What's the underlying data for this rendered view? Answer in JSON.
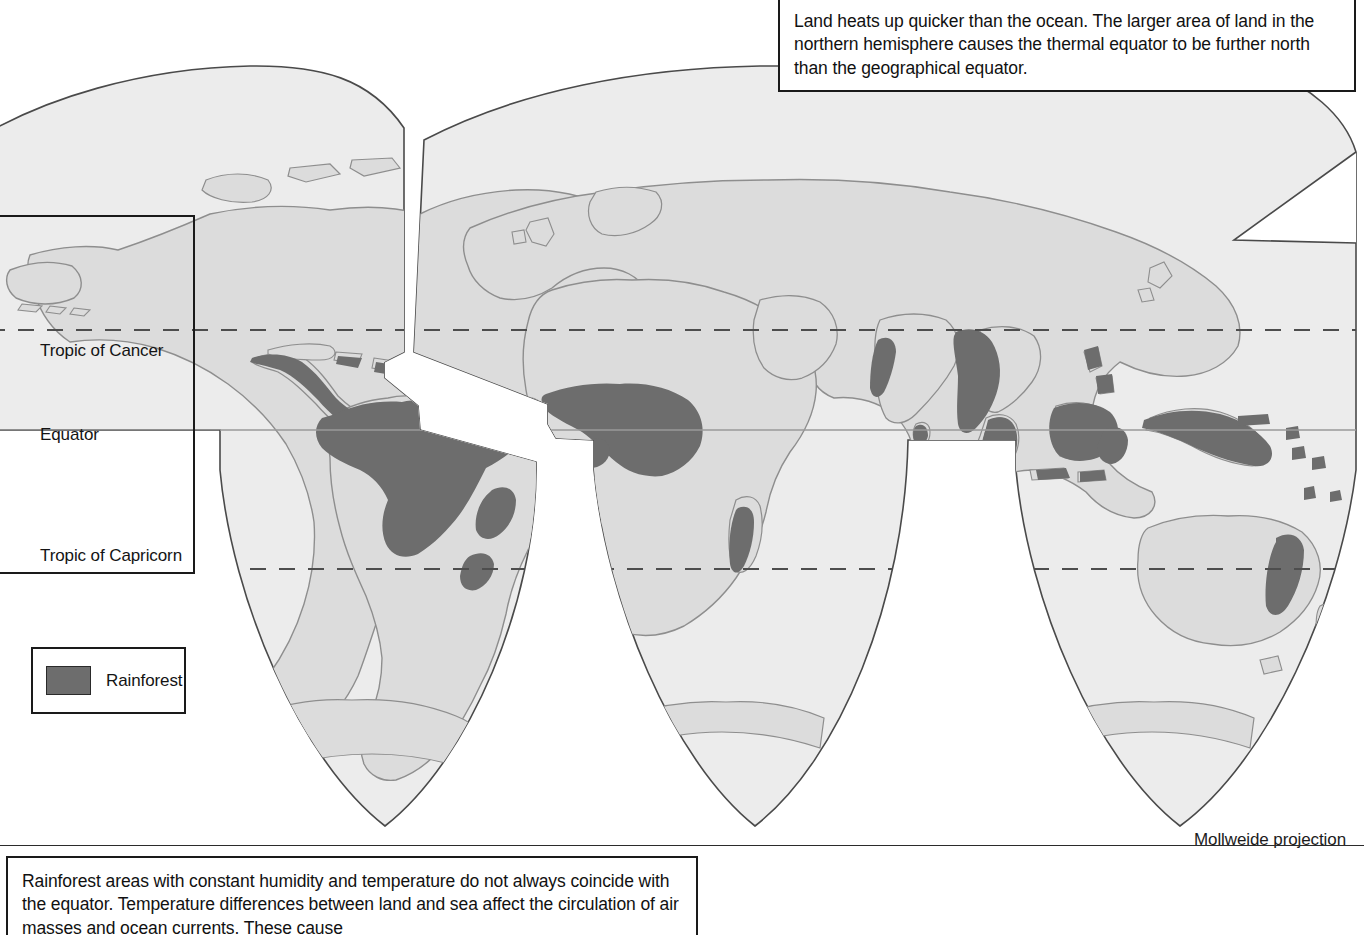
{
  "document": {
    "kind": "thematic-world-map",
    "projection_label": "Mollweide projection"
  },
  "top_callout": {
    "name": "thermal-equator-note",
    "text": "Land heats up quicker than the ocean. The larger area of land in the northern hemisphere causes the thermal equator to be further north than the geographical equator."
  },
  "bottom_callout": {
    "name": "rainforest-note",
    "text": "Rainforest areas with constant humidity and temperature do not always coincide with the equator. Temperature differences between land and sea affect the circulation of air masses and ocean currents. These cause"
  },
  "latitude_labels": {
    "tropic_of_cancer": "Tropic of Cancer",
    "equator": "Equator",
    "tropic_of_capricorn": "Tropic of Capricorn"
  },
  "legend": {
    "title": "",
    "items": [
      {
        "label": "Rainforest",
        "color": "#6d6d6d"
      }
    ]
  },
  "colors": {
    "ocean": "#ececec",
    "land": "#dcdcdc",
    "rainforest": "#6d6d6d",
    "outline": "#8e8e8e",
    "graticule": "#3c3c3c",
    "border": "#1a1a1a",
    "page": "#ffffff"
  },
  "map_features": {
    "graticule_lines": [
      {
        "name": "tropic-of-cancer",
        "style": "dashed"
      },
      {
        "name": "equator",
        "style": "solid"
      },
      {
        "name": "tropic-of-capricorn",
        "style": "dashed"
      }
    ],
    "lobes": [
      "americas-lobe",
      "africa-europe-lobe",
      "asia-pacific-lobe"
    ],
    "rainforest_regions": [
      "central-america",
      "caribbean",
      "amazon-basin",
      "brazil-atlantic-coast",
      "west-africa-guinea-coast",
      "congo-basin",
      "madagascar",
      "western-ghats-india",
      "sri-lanka",
      "indochina-malay-peninsula",
      "sumatra",
      "borneo",
      "sulawesi",
      "philippines",
      "new-guinea",
      "queensland-australia",
      "pacific-islands"
    ]
  }
}
